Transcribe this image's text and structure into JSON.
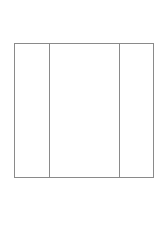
{
  "diagram": {
    "type": "three-column-box",
    "stroke_color": "#8a8a8a",
    "background": "#ffffff",
    "columns": [
      {
        "label": ""
      },
      {
        "label": ""
      },
      {
        "label": ""
      }
    ]
  }
}
